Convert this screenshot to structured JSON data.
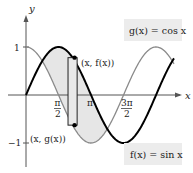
{
  "diagram": {
    "type": "function-plot",
    "axes": {
      "x_label": "x",
      "y_label": "y",
      "y_ticks": [
        {
          "value": 1,
          "label": "1"
        },
        {
          "value": -1,
          "label": "−1"
        }
      ],
      "x_ticks": [
        {
          "value": 1.5708,
          "num": "π",
          "den": "2"
        },
        {
          "value": 3.1416,
          "num": "π",
          "den": ""
        },
        {
          "value": 4.7124,
          "num": "3π",
          "den": "2"
        }
      ]
    },
    "curves": [
      {
        "name": "f",
        "expr": "sin x",
        "color": "#000000",
        "width": 2,
        "x_range": [
          0,
          7.15
        ]
      },
      {
        "name": "g",
        "expr": "cos x",
        "color": "#8a8a8a",
        "width": 1.2,
        "x_range": [
          0,
          7.15
        ]
      }
    ],
    "shaded_region": {
      "from": 0.7854,
      "to": 3.927,
      "color": "#e6e6e6",
      "description": "region between f(x)=sin x and g(x)=cos x"
    },
    "representative_rectangle": {
      "x": 2.25,
      "width": 0.44,
      "fill": "#e9e9e9"
    },
    "point_labels": {
      "top": "(x, f(x))",
      "bottom": "(x, g(x))"
    },
    "legend": {
      "g": "g(x) = cos x",
      "f": "f(x) = sin x",
      "box_color": "#ececec"
    }
  },
  "chart_data": {
    "type": "line",
    "title": "",
    "xlabel": "x",
    "ylabel": "y",
    "x_ticks": [
      "π/2",
      "π",
      "3π/2"
    ],
    "y_ticks": [
      "1",
      "−1"
    ],
    "ylim": [
      -1,
      1
    ],
    "series": [
      {
        "name": "f(x) = sin x",
        "formula": "sin x",
        "domain": [
          0,
          7.15
        ]
      },
      {
        "name": "g(x) = cos x",
        "formula": "cos x",
        "domain": [
          0,
          7.15
        ]
      }
    ],
    "annotations": [
      "(x, f(x))",
      "(x, g(x))"
    ],
    "shaded_between": [
      0.7854,
      3.927
    ]
  }
}
